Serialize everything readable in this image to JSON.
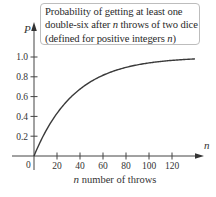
{
  "chart_data": {
    "type": "line",
    "annotation_lines": [
      [
        "Probability of getting at least one"
      ],
      [
        "double-six after ",
        "n",
        " throws of two dice"
      ],
      [
        "(defined for positive integers ",
        "n",
        ")"
      ]
    ],
    "xlabel": "n number of throws",
    "xlabel_var": "n",
    "xlabel_rest": " number of throws",
    "ylabel": "P",
    "x_axis_var": "n",
    "origin_label": "0",
    "xlim": [
      0,
      140
    ],
    "ylim": [
      0,
      1.0
    ],
    "x_ticks": [
      20,
      40,
      60,
      80,
      100,
      120
    ],
    "y_ticks": [
      "0.2",
      "0.4",
      "0.6",
      "0.8",
      "1.0"
    ],
    "y_tick_values": [
      0.2,
      0.4,
      0.6,
      0.8,
      1.0
    ],
    "grid": false,
    "legend": null,
    "formula": "P(n) = 1 - (35/36)^n",
    "series": [
      {
        "name": "P(n)",
        "x": [
          0,
          5,
          10,
          20,
          30,
          40,
          50,
          60,
          70,
          80,
          90,
          100,
          110,
          120,
          130,
          140
        ],
        "values": [
          0,
          0.131,
          0.246,
          0.431,
          0.571,
          0.676,
          0.756,
          0.816,
          0.861,
          0.895,
          0.921,
          0.94,
          0.955,
          0.966,
          0.974,
          0.981
        ]
      }
    ],
    "colors": {
      "curve": "#3a3a3a",
      "axis": "#444444",
      "box_border": "#bdbdbd"
    }
  }
}
